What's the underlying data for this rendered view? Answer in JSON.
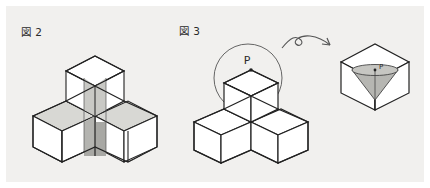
{
  "page": {
    "background_color": "#f1f0ee",
    "frame_color": "#ffffff",
    "width": 430,
    "height": 188
  },
  "figures": [
    {
      "label": "図 2",
      "description": "Four unit cubes arranged as an L/T solid: three cubes on the bottom layer and one cube stacked on the rear cube, with a shaded vertical cross-section plane and dotted hidden edges.",
      "cube_count": 4,
      "shaded": true,
      "hidden_edges_style": "dotted"
    },
    {
      "label": "図 3",
      "description": "The same four-cube solid with a circle (sphere outline) around the top cube, a marked point P on the top face, a curved arrow pointing right to a single cube containing a shaded inverted cone with apex P.",
      "cube_count": 4,
      "shaded": false,
      "point_label": "P",
      "callout_point_label": "P"
    }
  ],
  "annotations": {
    "point_p_main": "P",
    "point_p_detail": "P",
    "arrow": "curved-arrow-right"
  },
  "colors": {
    "stroke": "#222222",
    "thin_stroke": "#555555",
    "face_light": "#ffffff",
    "face_shade_light": "#d8d8d4",
    "face_shade_mid": "#c9c9c5",
    "face_shade_dark": "#a8a8a4",
    "background": "#f1f0ee",
    "frame": "#ffffff"
  }
}
